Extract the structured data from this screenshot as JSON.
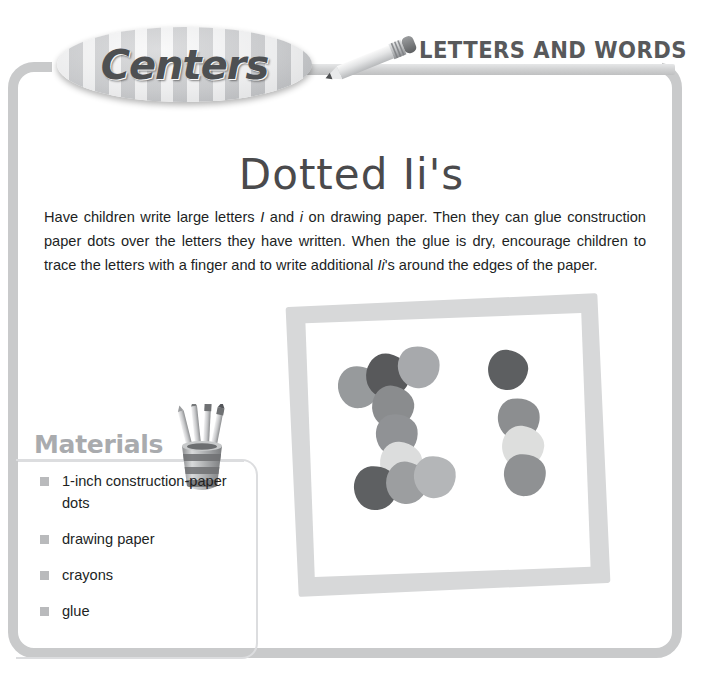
{
  "banner": {
    "badge_label": "Centers",
    "section_title": "LETTERS AND WORDS",
    "pencil_icon": "pencil-icon"
  },
  "activity": {
    "title": "Dotted Ii's",
    "body_html": "Have children write large letters <i>I</i> and <i>i</i> on drawing paper. Then they can glue construction paper dots over the letters they have written. When the glue is dry, encourage children to trace the letters with a finger and to write additional <i>Ii</i>'s around the edges of the paper."
  },
  "materials": {
    "heading": "Materials",
    "cup_icon": "pencil-cup-icon",
    "items": [
      "1-inch construction-paper dots",
      "drawing paper",
      "crayons",
      "glue"
    ]
  },
  "illustration": {
    "name": "dotted-letters-paper-illustration",
    "paper_border_color": "#c9cacb",
    "paper_fill_color": "#ffffff",
    "dots": [
      {
        "letter": "I",
        "part": "top-bar-left",
        "x": 62,
        "y": 84,
        "w": 42,
        "h": 42,
        "color": "#979a9c",
        "rot": -6
      },
      {
        "letter": "I",
        "part": "top-bar-mid",
        "x": 90,
        "y": 72,
        "w": 44,
        "h": 44,
        "color": "#58595b",
        "rot": 12
      },
      {
        "letter": "I",
        "part": "top-bar-right",
        "x": 122,
        "y": 64,
        "w": 42,
        "h": 42,
        "color": "#a7a9ac",
        "rot": -10
      },
      {
        "letter": "I",
        "part": "stem-1",
        "x": 96,
        "y": 104,
        "w": 42,
        "h": 42,
        "color": "#8a8c8e",
        "rot": 8
      },
      {
        "letter": "I",
        "part": "stem-2",
        "x": 100,
        "y": 132,
        "w": 42,
        "h": 42,
        "color": "#909295",
        "rot": -8
      },
      {
        "letter": "I",
        "part": "stem-3",
        "x": 104,
        "y": 160,
        "w": 42,
        "h": 42,
        "color": "#dcdddd",
        "rot": 5
      },
      {
        "letter": "I",
        "part": "base-left",
        "x": 78,
        "y": 184,
        "w": 44,
        "h": 44,
        "color": "#5e6062",
        "rot": -4
      },
      {
        "letter": "I",
        "part": "base-mid",
        "x": 110,
        "y": 180,
        "w": 42,
        "h": 42,
        "color": "#9c9ea0",
        "rot": 10
      },
      {
        "letter": "I",
        "part": "base-right",
        "x": 138,
        "y": 174,
        "w": 42,
        "h": 42,
        "color": "#b4b6b8",
        "rot": -7
      },
      {
        "letter": "i",
        "part": "tittle",
        "x": 212,
        "y": 68,
        "w": 40,
        "h": 40,
        "color": "#5d5f61",
        "rot": 6
      },
      {
        "letter": "i",
        "part": "stem-1",
        "x": 222,
        "y": 116,
        "w": 42,
        "h": 42,
        "color": "#8c8e90",
        "rot": -9
      },
      {
        "letter": "i",
        "part": "stem-2",
        "x": 226,
        "y": 144,
        "w": 42,
        "h": 42,
        "color": "#dddedd",
        "rot": 7
      },
      {
        "letter": "i",
        "part": "stem-3",
        "x": 228,
        "y": 172,
        "w": 42,
        "h": 42,
        "color": "#8f9193",
        "rot": -5
      }
    ]
  },
  "colors": {
    "frame": "#c9cacb",
    "text": "#221f1f",
    "heading_gray": "#a9abae",
    "title_gray": "#4a4a4c"
  }
}
